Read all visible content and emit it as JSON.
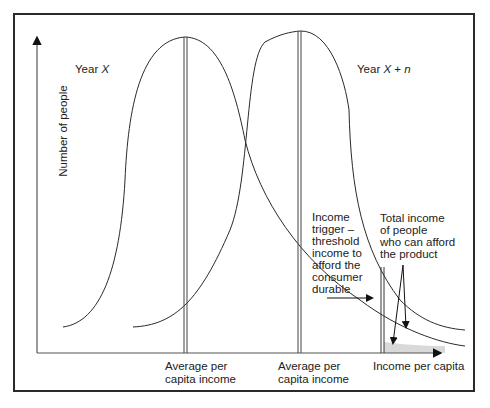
{
  "figure": {
    "axes": {
      "y_label": "Number of people",
      "x_label": "Income per capita"
    },
    "curves": [
      {
        "name": "Year X",
        "label_prefix": "Year ",
        "label_italic": "X"
      },
      {
        "name": "Year X + n",
        "label_prefix": "Year ",
        "label_italic": "X",
        "label_suffix_plain": " + ",
        "label_suffix_italic": "n"
      }
    ],
    "markers": [
      {
        "label_line1": "Average per",
        "label_line2": "capita income"
      },
      {
        "label_line1": "Average per",
        "label_line2": "capita income"
      }
    ],
    "annotations": {
      "income_trigger": [
        "Income",
        "trigger –",
        "threshold",
        "income to",
        "afford the",
        "consumer",
        "durable"
      ],
      "total_income": [
        "Total income",
        "of people",
        "who can afford",
        "the product"
      ]
    },
    "colors": {
      "line": "#2a2a2a",
      "shade": "#d9d9d9",
      "background": "#ffffff"
    }
  }
}
